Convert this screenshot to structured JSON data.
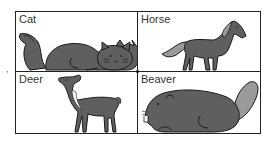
{
  "figure": {
    "side_mark": ",",
    "panels": [
      {
        "label": "Cat",
        "animal": "cat-icon"
      },
      {
        "label": "Horse",
        "animal": "horse-icon"
      },
      {
        "label": "Deer",
        "animal": "deer-icon"
      },
      {
        "label": "Beaver",
        "animal": "beaver-icon"
      }
    ],
    "colors": {
      "fill": "#5f5f5f",
      "light_fill": "#9a9a9a",
      "stroke": "#1a1a1a"
    }
  }
}
